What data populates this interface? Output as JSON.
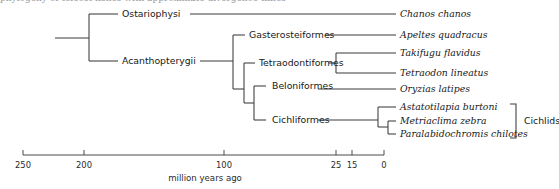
{
  "figure": {
    "kind": "phylogenetic-tree",
    "cut_off_caption_top": "phylogeny of teleost fishes with approximate divergence times",
    "axis": {
      "title": "million years ago",
      "ticks": [
        {
          "label": "250",
          "mya": 250,
          "x": 23
        },
        {
          "label": "200",
          "mya": 200,
          "x": 84
        },
        {
          "label": "100",
          "mya": 100,
          "x": 224
        },
        {
          "label": "25",
          "mya": 25,
          "x": 336
        },
        {
          "label": "15",
          "mya": 15,
          "x": 352
        },
        {
          "label": "0",
          "mya": 0,
          "x": 384
        }
      ],
      "line": {
        "x1": 23,
        "x2": 384,
        "y": 155
      }
    },
    "group_brackets": [
      {
        "label": "Cichlids",
        "x": 515,
        "y_top": 104,
        "y_bottom": 138,
        "label_x": 524,
        "label_y": 121
      }
    ],
    "clade_labels": [
      {
        "id": "ostariophysi",
        "text": "Ostariophysi",
        "x": 122,
        "y": 14
      },
      {
        "id": "acanthopterygii",
        "text": "Acanthopterygii",
        "x": 122,
        "y": 61
      },
      {
        "id": "gasterosteiformes",
        "text": "Gasterosteiformes",
        "x": 249,
        "y": 35
      },
      {
        "id": "tetraodontiformes",
        "text": "Tetraodontiformes",
        "x": 259,
        "y": 63
      },
      {
        "id": "beloniformes",
        "text": "Beloniformes",
        "x": 272,
        "y": 86
      },
      {
        "id": "cichliformes",
        "text": "Cichliformes",
        "x": 272,
        "y": 120
      }
    ],
    "tips": [
      {
        "id": "chanos-chanos",
        "name": "Chanos chanos",
        "x": 400,
        "y": 14
      },
      {
        "id": "apeltes-quadracus",
        "name": "Apeltes quadracus",
        "x": 400,
        "y": 35
      },
      {
        "id": "takifugu-flavidus",
        "name": "Takifugu flavidus",
        "x": 400,
        "y": 53
      },
      {
        "id": "tetraodon-lineatus",
        "name": "Tetraodon lineatus",
        "x": 400,
        "y": 73
      },
      {
        "id": "oryzias-latipes",
        "name": "Oryzias latipes",
        "x": 400,
        "y": 89
      },
      {
        "id": "astatotilapia-burtoni",
        "name": "Astatotilapia burtoni",
        "x": 400,
        "y": 107
      },
      {
        "id": "metriaclima-zebra",
        "name": "Metriaclima zebra",
        "x": 400,
        "y": 121
      },
      {
        "id": "paralabidochromis-chilotes",
        "name": "Paralabidochromis chilotes",
        "x": 400,
        "y": 134
      }
    ],
    "colors": {
      "branch": "#3a3a3a",
      "axis": "#4a4a4a",
      "text": "#171717",
      "background": "#ffffff"
    }
  }
}
